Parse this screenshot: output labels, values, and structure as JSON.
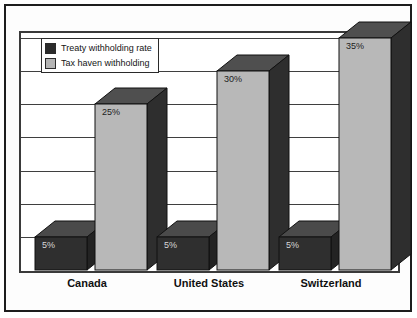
{
  "chart_data": {
    "type": "bar",
    "title": "",
    "subtitle": "",
    "xlabel": "",
    "ylabel": "",
    "categories": [
      "Canada",
      "United States",
      "Switzerland"
    ],
    "series": [
      {
        "name": "Treaty withholding rate",
        "color": "#2b2b2b",
        "values": [
          5,
          5,
          5
        ],
        "labels": [
          "5%",
          "5%",
          "5%"
        ]
      },
      {
        "name": "Tax haven withholding",
        "color": "#b4b4b4",
        "values": [
          25,
          30,
          35
        ],
        "labels": [
          "25%",
          "30%",
          "35%"
        ]
      }
    ],
    "ylim": [
      0,
      35
    ],
    "gridlines": [
      0,
      5,
      10,
      15,
      20,
      25,
      30,
      35
    ],
    "grid": true,
    "axis_tick_labels": [],
    "legend_position": "top-left-inside",
    "style": "3d-column"
  },
  "legend": {
    "items": [
      {
        "label": "Treaty withholding rate",
        "swatch_color": "#2b2b2b"
      },
      {
        "label": "Tax haven withholding",
        "swatch_color": "#b4b4b4"
      }
    ]
  },
  "colors": {
    "treaty_front": "#2f2f2f",
    "treaty_top": "#4a4a4a",
    "treaty_side": "#232323",
    "haven_front": "#b8b8b8",
    "haven_top": "#4f4f4f",
    "haven_side": "#2e2e2e",
    "grid": "#3f3f3f",
    "frame": "#3a3a3a",
    "outer_border": "#1d1d1d",
    "background": "#ffffff"
  }
}
